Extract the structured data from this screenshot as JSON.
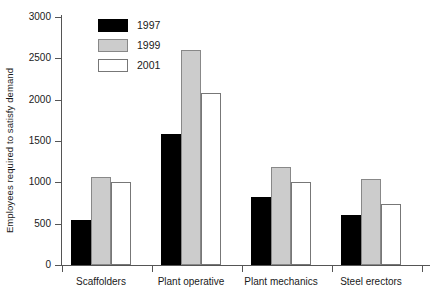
{
  "chart_data": {
    "type": "bar",
    "title": "",
    "xlabel": "",
    "ylabel": "Employees required to satisfy demand",
    "ylim": [
      0,
      3000
    ],
    "ytick_values": [
      0,
      500,
      1000,
      1500,
      2000,
      2500,
      3000
    ],
    "ytick_labels": [
      "0",
      "500",
      "1000",
      "1500",
      "2000",
      "2500",
      "3000"
    ],
    "grid": false,
    "legend_position": "top-left-inside",
    "categories": [
      "Scaffolders",
      "Plant operative",
      "Plant mechanics",
      "Steel erectors"
    ],
    "series": [
      {
        "name": "1997",
        "color": "#000000",
        "values": [
          550,
          1580,
          820,
          600
        ]
      },
      {
        "name": "1999",
        "color": "#cccccc",
        "values": [
          1070,
          2600,
          1180,
          1040
        ]
      },
      {
        "name": "2001",
        "color": "#ffffff",
        "values": [
          1000,
          2080,
          1000,
          740
        ]
      }
    ]
  },
  "legend": {
    "items": [
      {
        "label": "1997"
      },
      {
        "label": "1999"
      },
      {
        "label": "2001"
      }
    ]
  },
  "axis": {
    "y_title": "Employees required to satisfy demand"
  }
}
